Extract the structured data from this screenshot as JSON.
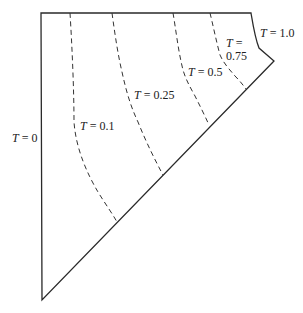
{
  "diagram": {
    "type": "isotherm-contour-diagram",
    "boundary_labels": {
      "left": {
        "var": "T",
        "text": " = 0"
      },
      "right": {
        "var": "T",
        "text": " = 1.0"
      }
    },
    "isotherms": [
      {
        "var": "T",
        "text": " = 0.1",
        "value": 0.1
      },
      {
        "var": "T",
        "text": " = 0.25",
        "value": 0.25
      },
      {
        "var": "T",
        "text": " = 0.5",
        "value": 0.5
      },
      {
        "var": "T",
        "text1": " =",
        "text2": "0.75",
        "value": 0.75
      }
    ],
    "colors": {
      "line": "#2a2a2a",
      "background": "#ffffff"
    }
  }
}
